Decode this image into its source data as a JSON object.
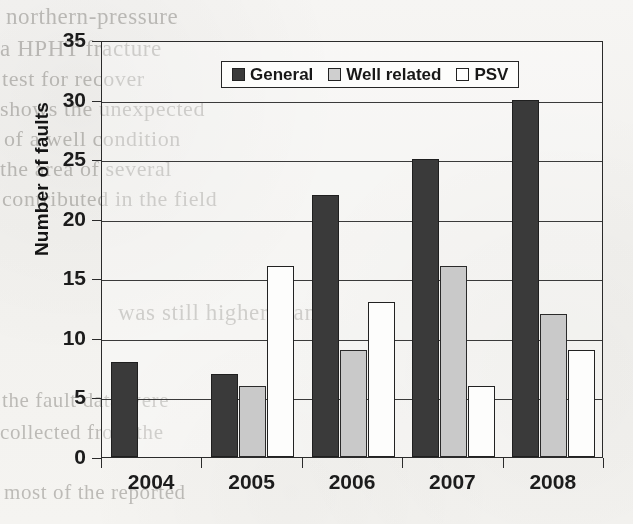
{
  "chart_data": {
    "type": "bar",
    "title": "",
    "subtitle": "",
    "xlabel": "",
    "ylabel": "Number of faults",
    "categories": [
      "2004",
      "2005",
      "2006",
      "2007",
      "2008"
    ],
    "series": [
      {
        "name": "General",
        "values": [
          8,
          7,
          22,
          25,
          30
        ],
        "color": "#3a3a3a"
      },
      {
        "name": "Well related",
        "values": [
          0,
          6,
          9,
          16,
          12
        ],
        "color": "#c9c9c9"
      },
      {
        "name": "PSV",
        "values": [
          0,
          16,
          13,
          6,
          9
        ],
        "color": "#ffffff"
      }
    ],
    "ylim": [
      0,
      35
    ],
    "yticks": [
      0,
      5,
      10,
      15,
      20,
      25,
      30,
      35
    ],
    "ytick_labels": [
      "0",
      "5",
      "10",
      "15",
      "20",
      "25",
      "30",
      "35"
    ],
    "grid": true,
    "grid_axis": "y",
    "legend_position": "top-center",
    "annotations": []
  },
  "legend": {
    "entries": [
      {
        "label": "General",
        "swatch": "dark-filled-square"
      },
      {
        "label": "Well related",
        "swatch": "light-gray-square"
      },
      {
        "label": "PSV",
        "swatch": "white-square"
      }
    ]
  },
  "axes": {
    "y_title": "Number of faults",
    "y_tick_labels": [
      "35",
      "30",
      "25",
      "20",
      "15",
      "10",
      "5",
      "0"
    ],
    "x_tick_labels": [
      "2004",
      "2005",
      "2006",
      "2007",
      "2008"
    ]
  },
  "scan_background": {
    "bleed_through_lines": [
      "northern-pressure",
      "a HPHT fracture",
      "test for recover",
      "shows the unexpected",
      "of a well condition",
      "the area of several",
      "contributed in the field",
      "was still higher than",
      "the fault data were",
      "collected from the",
      "most of the reported"
    ]
  },
  "colors": {
    "series_general": "#3a3a3a",
    "series_well_related": "#c9c9c9",
    "series_psv": "#ffffff",
    "axis": "#2b2b2b",
    "paper": "#f3f2ef"
  }
}
